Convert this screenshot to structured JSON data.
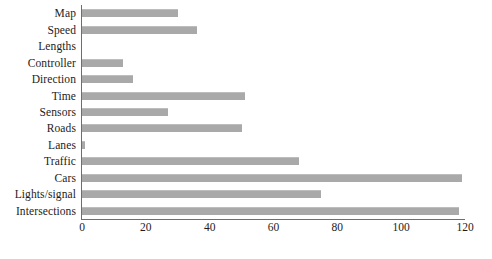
{
  "chart_data": {
    "type": "bar",
    "orientation": "horizontal",
    "title": "",
    "subtitle": "",
    "xlabel": "",
    "ylabel": "",
    "xlim": [
      0,
      120
    ],
    "xticks": [
      0,
      20,
      40,
      60,
      80,
      100,
      120
    ],
    "xtick_labels": [
      "0",
      "20",
      "40",
      "60",
      "80",
      "100",
      "120"
    ],
    "grid": false,
    "legend": null,
    "bar_color": "#a9a9a9",
    "axis_color": "#6e6e6e",
    "categories": [
      "Map",
      "Speed",
      "Lengths",
      "Controller",
      "Direction",
      "Time",
      "Sensors",
      "Roads",
      "Lanes",
      "Traffic",
      "Cars",
      "Lights/signal",
      "Intersections"
    ],
    "values": [
      30,
      36,
      0,
      13,
      16,
      51,
      27,
      50,
      1,
      68,
      119,
      75,
      118
    ]
  }
}
